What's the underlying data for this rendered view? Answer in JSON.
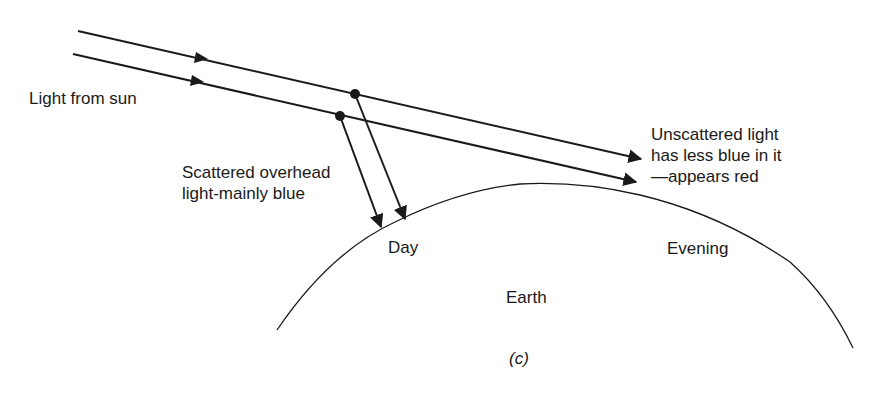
{
  "labels": {
    "light_from_sun": "Light from sun",
    "scattered": "Scattered overhead\nlight-mainly blue",
    "unscattered": "Unscattered light\nhas less blue in it\n—appears red",
    "day": "Day",
    "evening": "Evening",
    "earth": "Earth",
    "caption": "(c)"
  },
  "colors": {
    "ink": "#1a1a1a",
    "background": "#ffffff"
  }
}
